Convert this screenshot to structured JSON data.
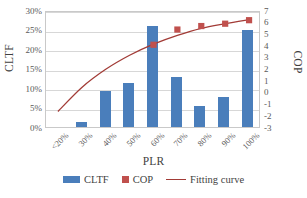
{
  "chart_data": {
    "type": "bar",
    "title": "",
    "subtitle": "",
    "xlabel": "PLR",
    "ylabel": "CLTF",
    "y2label": "COP",
    "categories": [
      "<20%",
      "30%",
      "40%",
      "50%",
      "60%",
      "70%",
      "80%",
      "90%",
      "100%"
    ],
    "ylim": [
      0,
      30
    ],
    "yticks": [
      "0%",
      "5%",
      "10%",
      "15%",
      "20%",
      "25%",
      "30%"
    ],
    "ytick_values": [
      0,
      5,
      10,
      15,
      20,
      25,
      30
    ],
    "y2lim": [
      -3,
      7
    ],
    "y2ticks": [
      "-3",
      "-2",
      "-1",
      "0",
      "1",
      "2",
      "3",
      "4",
      "5",
      "6",
      "7"
    ],
    "y2tick_values": [
      -3,
      -2,
      -1,
      0,
      1,
      2,
      3,
      4,
      5,
      6,
      7
    ],
    "grid": true,
    "legend_position": "bottom",
    "series": [
      {
        "name": "CLTF",
        "type": "bar",
        "axis": "left",
        "unit": "%",
        "color": "#4a7ebb",
        "values": [
          0,
          1.2,
          9.3,
          11.3,
          26.0,
          12.9,
          5.3,
          7.8,
          25.0
        ]
      },
      {
        "name": "COP",
        "type": "scatter",
        "axis": "right",
        "color": "#c0504d",
        "values": [
          null,
          null,
          null,
          null,
          4.2,
          5.5,
          5.8,
          6.0,
          6.3
        ]
      },
      {
        "name": "Fitting curve",
        "type": "line",
        "axis": "right",
        "color": "#a23b36",
        "x": [
          "<20%",
          "30%",
          "40%",
          "50%",
          "60%",
          "70%",
          "80%",
          "90%",
          "100%"
        ],
        "values": [
          -1.5,
          0.55,
          2.1,
          3.3,
          4.25,
          5.0,
          5.6,
          6.0,
          6.35
        ]
      }
    ]
  },
  "axes": {
    "x_title": "PLR",
    "y_left_title": "CLTF",
    "y_right_title": "COP"
  },
  "legend": {
    "items": [
      {
        "label": "CLTF",
        "icon": "bar-swatch-icon",
        "color": "#4a7ebb"
      },
      {
        "label": "COP",
        "icon": "square-marker-icon",
        "color": "#c0504d"
      },
      {
        "label": "Fitting curve",
        "icon": "line-swatch-icon",
        "color": "#a23b36"
      }
    ]
  }
}
